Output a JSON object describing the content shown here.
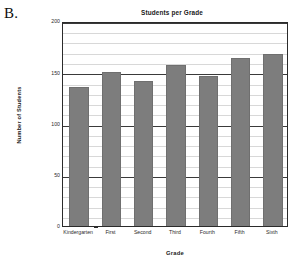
{
  "figure": {
    "panel_label": "B."
  },
  "chart_data": {
    "type": "bar",
    "title": "Students per Grade",
    "xlabel": "Grade",
    "ylabel": "Number of Students",
    "categories": [
      "Kindergarten",
      "First",
      "Second",
      "Third",
      "Fourth",
      "Fifth",
      "Sixth"
    ],
    "values": [
      136,
      150,
      141,
      157,
      146,
      164,
      168
    ],
    "ylim": [
      0,
      200
    ],
    "ytick_labels": [
      "0",
      "50",
      "100",
      "150",
      "200"
    ],
    "ytick_values": [
      0,
      50,
      100,
      150,
      200
    ],
    "minor_gridline_step": 10,
    "grid": true,
    "legend": null,
    "bar_color": "#7d7d7d",
    "axis_color": "#2b2b2b",
    "gridline_color": "#d8d8d8",
    "background_color": "#ffffff"
  }
}
